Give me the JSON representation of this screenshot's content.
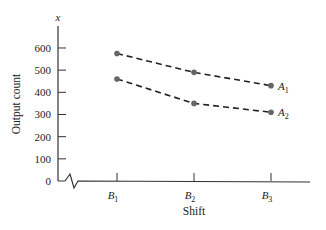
{
  "chart_data": {
    "type": "line",
    "title": "",
    "xlabel": "Shift",
    "ylabel": "Output count",
    "y_axis_symbol": "x",
    "categories": [
      "B1",
      "B2",
      "B3"
    ],
    "category_labels": [
      {
        "main": "B",
        "sub": "1"
      },
      {
        "main": "B",
        "sub": "2"
      },
      {
        "main": "B",
        "sub": "3"
      }
    ],
    "series": [
      {
        "name": "A1",
        "label_main": "A",
        "label_sub": "1",
        "values": [
          575,
          490,
          430
        ],
        "style": "dashed",
        "color": "#222222",
        "marker_color": "#666666"
      },
      {
        "name": "A2",
        "label_main": "A",
        "label_sub": "2",
        "values": [
          460,
          350,
          310
        ],
        "style": "dashed",
        "color": "#222222",
        "marker_color": "#666666"
      }
    ],
    "yticks": [
      0,
      100,
      200,
      300,
      400,
      500,
      600
    ],
    "ylim": [
      0,
      700
    ],
    "axis_break": true,
    "grid": false,
    "legend": "inline labels at right end of lines"
  }
}
